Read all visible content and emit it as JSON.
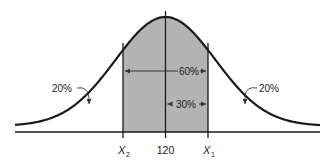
{
  "chart_data": {
    "type": "area",
    "title": "",
    "xlabel": "",
    "ylabel": "",
    "grid": false,
    "mean": 120,
    "x_ticks": [
      {
        "label": "X",
        "sub": "2",
        "position": "left"
      },
      {
        "label": "120",
        "sub": "",
        "position": "center"
      },
      {
        "label": "X",
        "sub": "1",
        "position": "right"
      }
    ],
    "regions": [
      {
        "name": "left-tail",
        "label": "20%",
        "percent": 20
      },
      {
        "name": "central",
        "label": "60%",
        "percent": 60,
        "shaded": true
      },
      {
        "name": "mean-to-x1",
        "label": "30%",
        "percent": 30
      },
      {
        "name": "right-tail",
        "label": "20%",
        "percent": 20
      }
    ],
    "shade_color": "#b3b3b3",
    "line_color": "#1a1a1a"
  },
  "labels": {
    "left_tail": "20%",
    "right_tail": "20%",
    "central": "60%",
    "half": "30%",
    "x2_main": "X",
    "x2_sub": "2",
    "mean": "120",
    "x1_main": "X",
    "x1_sub": "1"
  }
}
